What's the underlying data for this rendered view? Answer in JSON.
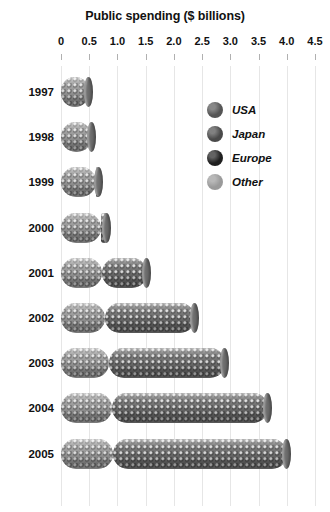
{
  "chart_data": {
    "type": "bar",
    "orientation": "horizontal",
    "title": "Public spending ($ billions)",
    "xlabel": "",
    "ylabel": "",
    "xlim": [
      0,
      4.5
    ],
    "ylim": null,
    "grid": true,
    "xticks": [
      "0",
      "0.5",
      "1.0",
      "1.5",
      "2.0",
      "2.5",
      "3.0",
      "3.5",
      "4.0",
      "4.5"
    ],
    "xtick_values": [
      0,
      0.5,
      1.0,
      1.5,
      2.0,
      2.5,
      3.0,
      3.5,
      4.0,
      4.5
    ],
    "categories": [
      "1997",
      "1998",
      "1999",
      "2000",
      "2001",
      "2002",
      "2003",
      "2004",
      "2005"
    ],
    "stacked": true,
    "legend_position": "inside-top-right",
    "series": [
      {
        "name": "Other",
        "color": "#9b9b9b",
        "values": [
          0.5,
          0.55,
          0.62,
          0.7,
          0.72,
          0.78,
          0.85,
          0.9,
          0.93
        ]
      },
      {
        "name": "USA",
        "color": "#6e6e6e",
        "values": [
          0.0,
          0.0,
          0.05,
          0.12,
          0.8,
          1.6,
          2.05,
          2.77,
          3.07
        ]
      }
    ],
    "totals": [
      0.5,
      0.55,
      0.67,
      0.82,
      1.52,
      2.38,
      2.9,
      3.67,
      4.0
    ],
    "bars": [
      {
        "category": "1997",
        "total": 0.5,
        "segments": [
          {
            "series": "Other",
            "start": 0.0,
            "end": 0.5
          },
          {
            "series": "USA",
            "start": 0.5,
            "end": 0.5
          }
        ]
      },
      {
        "category": "1998",
        "total": 0.55,
        "segments": [
          {
            "series": "Other",
            "start": 0.0,
            "end": 0.55
          },
          {
            "series": "USA",
            "start": 0.55,
            "end": 0.55
          }
        ]
      },
      {
        "category": "1999",
        "total": 0.67,
        "segments": [
          {
            "series": "Other",
            "start": 0.0,
            "end": 0.62
          },
          {
            "series": "USA",
            "start": 0.62,
            "end": 0.67
          }
        ]
      },
      {
        "category": "2000",
        "total": 0.82,
        "segments": [
          {
            "series": "Other",
            "start": 0.0,
            "end": 0.7
          },
          {
            "series": "USA",
            "start": 0.7,
            "end": 0.82
          }
        ]
      },
      {
        "category": "2001",
        "total": 1.52,
        "segments": [
          {
            "series": "Other",
            "start": 0.0,
            "end": 0.72
          },
          {
            "series": "USA",
            "start": 0.72,
            "end": 1.52
          }
        ]
      },
      {
        "category": "2002",
        "total": 2.38,
        "segments": [
          {
            "series": "Other",
            "start": 0.0,
            "end": 0.78
          },
          {
            "series": "USA",
            "start": 0.78,
            "end": 2.38
          }
        ]
      },
      {
        "category": "2003",
        "total": 2.9,
        "segments": [
          {
            "series": "Other",
            "start": 0.0,
            "end": 0.85
          },
          {
            "series": "USA",
            "start": 0.85,
            "end": 2.9
          }
        ]
      },
      {
        "category": "2004",
        "total": 3.67,
        "segments": [
          {
            "series": "Other",
            "start": 0.0,
            "end": 0.9
          },
          {
            "series": "USA",
            "start": 0.9,
            "end": 3.67
          }
        ]
      },
      {
        "category": "2005",
        "total": 4.0,
        "segments": [
          {
            "series": "Other",
            "start": 0.0,
            "end": 0.93
          },
          {
            "series": "USA",
            "start": 0.93,
            "end": 4.0
          }
        ]
      }
    ],
    "legend": [
      {
        "label": "USA",
        "color": "#555555"
      },
      {
        "label": "Japan",
        "color": "#4a4a4a"
      },
      {
        "label": "Europe",
        "color": "#1f1f1f"
      },
      {
        "label": "Other",
        "color": "#9a9a9a"
      }
    ]
  },
  "colors": {
    "background": "#ffffff",
    "text": "#111111",
    "gridline": "#e6e6e6",
    "tick": "#b0b0b0"
  }
}
